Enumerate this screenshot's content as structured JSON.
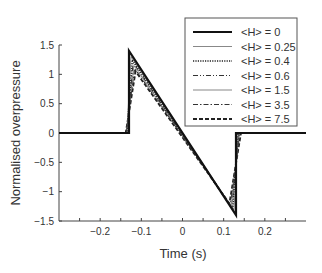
{
  "chart_data": {
    "type": "line",
    "title": "",
    "xlabel": "Time (s)",
    "ylabel": "Normalised overpressure",
    "xlim": [
      -0.3,
      0.3
    ],
    "ylim": [
      -1.5,
      1.5
    ],
    "xticks": [
      -0.2,
      -0.1,
      0,
      0.1,
      0.2
    ],
    "xtick_labels": [
      "−0.2",
      "−0.1",
      "0",
      "0.1",
      "0.2"
    ],
    "yticks": [
      1.5,
      1,
      0.5,
      0,
      -0.5,
      -1,
      -1.5
    ],
    "ytick_labels": [
      "1.5",
      "1",
      "0.5",
      "0",
      "−0.5",
      "−1",
      "−1.5"
    ],
    "grid": false,
    "legend_position": "upper right",
    "series": [
      {
        "name": "<H> = 0",
        "style": "solid-thick",
        "x": [
          -0.3,
          -0.13,
          -0.13,
          0.13,
          0.13,
          0.3
        ],
        "y": [
          0,
          0,
          1.4,
          -1.4,
          0,
          0
        ]
      },
      {
        "name": "<H> = 0.25",
        "style": "solid-thin",
        "x": [
          -0.3,
          -0.135,
          -0.125,
          0.125,
          0.135,
          0.3
        ],
        "y": [
          0,
          0,
          1.3,
          -1.32,
          0,
          0
        ]
      },
      {
        "name": "<H> = 0.4",
        "style": "dotted",
        "x": [
          -0.3,
          -0.135,
          -0.122,
          0.122,
          0.135,
          0.3
        ],
        "y": [
          0,
          0,
          1.25,
          -1.3,
          0,
          0
        ]
      },
      {
        "name": "<H> = 0.6",
        "style": "dash-dot-dot",
        "x": [
          -0.3,
          -0.135,
          -0.12,
          0.12,
          0.137,
          0.3
        ],
        "y": [
          0,
          0,
          1.2,
          -1.28,
          0,
          0
        ]
      },
      {
        "name": "<H> = 1.5",
        "style": "solid-thin",
        "x": [
          -0.3,
          -0.136,
          -0.118,
          0.118,
          0.138,
          0.3
        ],
        "y": [
          0,
          0,
          1.15,
          -1.25,
          0,
          0
        ]
      },
      {
        "name": "<H> = 3.5",
        "style": "dash-dot",
        "x": [
          -0.3,
          -0.137,
          -0.116,
          0.116,
          0.14,
          0.3
        ],
        "y": [
          0,
          0,
          1.1,
          -1.22,
          0,
          0
        ]
      },
      {
        "name": "<H> = 7.5",
        "style": "dashed",
        "x": [
          -0.3,
          -0.138,
          -0.114,
          0.114,
          0.142,
          0.3
        ],
        "y": [
          0,
          0,
          1.05,
          -1.2,
          0,
          0
        ]
      }
    ]
  }
}
